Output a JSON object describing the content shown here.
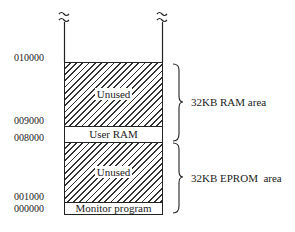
{
  "addresses": [
    {
      "label": "010000",
      "y": 58
    },
    {
      "label": "009000",
      "y": 121
    },
    {
      "label": "008000",
      "y": 138
    },
    {
      "label": "001000",
      "y": 197
    },
    {
      "label": "000000",
      "y": 209
    }
  ],
  "regions": [
    {
      "label": "Unused",
      "type": "hatched",
      "top": 62,
      "bottom": 126
    },
    {
      "label": "User RAM",
      "type": "plain",
      "top": 126,
      "bottom": 142
    },
    {
      "label": "Unused",
      "type": "hatched",
      "top": 142,
      "bottom": 202
    },
    {
      "label": "Monitor program",
      "type": "plain",
      "top": 202,
      "bottom": 214
    }
  ],
  "braces": [
    {
      "label": "32KB RAM area",
      "top": 64,
      "bottom": 141
    },
    {
      "label": "32KB EPROM  area",
      "top": 143,
      "bottom": 214
    }
  ],
  "break_symbol": "≈"
}
